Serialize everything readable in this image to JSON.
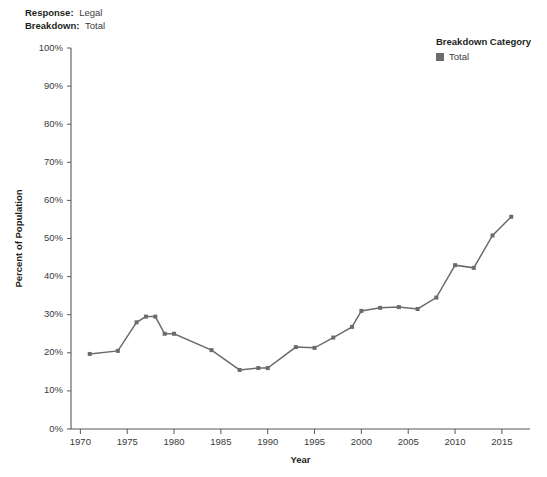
{
  "filters": {
    "rows": [
      {
        "label": "Response:",
        "value": "Legal"
      },
      {
        "label": "Breakdown:",
        "value": "Total"
      }
    ]
  },
  "legend": {
    "title": "Breakdown Category",
    "items": [
      {
        "label": "Total",
        "color": "#6b6b6b",
        "marker": "square"
      }
    ]
  },
  "colors": {
    "series": "#6b6b6b",
    "axis": "#58595b",
    "text": "#231f20",
    "tick_text": "#3b3b3b",
    "background": "#ffffff"
  },
  "chart_data": {
    "type": "line",
    "title": "",
    "subtitle": "",
    "xlabel": "Year",
    "ylabel": "Percent of Population",
    "xlim": [
      1969,
      2018
    ],
    "ylim": [
      0,
      100
    ],
    "grid": false,
    "legend_position": "top-right",
    "y_tick_labels": [
      "0%",
      "10%",
      "20%",
      "30%",
      "40%",
      "50%",
      "60%",
      "70%",
      "80%",
      "90%",
      "100%"
    ],
    "y_tick_values": [
      0,
      10,
      20,
      30,
      40,
      50,
      60,
      70,
      80,
      90,
      100
    ],
    "x_tick_labels": [
      "1970",
      "1975",
      "1980",
      "1985",
      "1990",
      "1995",
      "2000",
      "2005",
      "2010",
      "2015"
    ],
    "x_tick_values": [
      1970,
      1975,
      1980,
      1985,
      1990,
      1995,
      2000,
      2005,
      2010,
      2015
    ],
    "series": [
      {
        "name": "Total",
        "color": "#6b6b6b",
        "x": [
          1971,
          1974,
          1976,
          1977,
          1978,
          1979,
          1980,
          1984,
          1987,
          1989,
          1990,
          1993,
          1995,
          1997,
          1999,
          2000,
          2002,
          2004,
          2006,
          2008,
          2010,
          2012,
          2014,
          2016
        ],
        "values": [
          19.7,
          20.5,
          28.0,
          29.5,
          29.5,
          25.0,
          25.0,
          20.7,
          15.5,
          16.0,
          16.0,
          21.5,
          21.3,
          24.0,
          26.8,
          31.0,
          31.8,
          32.0,
          31.5,
          34.5,
          43.0,
          42.3,
          50.8,
          55.7
        ]
      }
    ],
    "annotations": []
  }
}
